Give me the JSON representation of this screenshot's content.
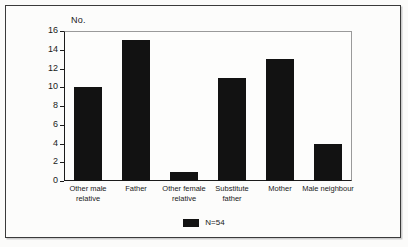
{
  "chart_data": {
    "type": "bar",
    "title": "",
    "xlabel": "",
    "ylabel": "No.",
    "ylim": [
      0,
      16
    ],
    "yticks": [
      0,
      2,
      4,
      6,
      8,
      10,
      12,
      14,
      16
    ],
    "grid": false,
    "legend_position": "bottom-center",
    "categories": [
      "Other male\nrelative",
      "Father",
      "Other female\nrelative",
      "Substitute\nfather",
      "Mother",
      "Male neighbour"
    ],
    "values": [
      10,
      15,
      1,
      11,
      13,
      4
    ],
    "series": [
      {
        "name": "N=54",
        "color": "#121212",
        "values": [
          10,
          15,
          1,
          11,
          13,
          4
        ]
      }
    ],
    "legend": [
      {
        "label": "N=54",
        "color": "#121212"
      }
    ]
  },
  "colors": {
    "bar": "#121212",
    "axis": "#1b1b1b",
    "plot_border": "#9a9a9a",
    "frame": "#3a3a3a",
    "background": "#fbfbfa",
    "text": "#1a1a1a"
  }
}
